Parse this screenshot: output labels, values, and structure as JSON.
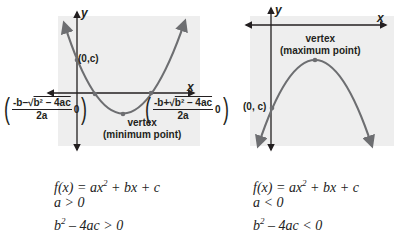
{
  "colors": {
    "background_panel": "#eeeeee",
    "curve": "#6d6e71",
    "axis": "#231f20",
    "text": "#231f20"
  },
  "left_graph": {
    "axis_labels": {
      "x": "x",
      "y": "y"
    },
    "y_intercept_label": "(0,c)",
    "vertex_label_line1": "vertex",
    "vertex_label_line2": "(minimum point)",
    "root_left": {
      "numerator_prefix": "-b–√",
      "radicand": "b² – 4ac",
      "denominator": "2a",
      "y": "0"
    },
    "root_right": {
      "numerator_prefix": "-b+√",
      "radicand": "b² – 4ac",
      "denominator": "2a",
      "y": "0"
    },
    "opens": "up"
  },
  "right_graph": {
    "axis_labels": {
      "x": "x",
      "y": "y"
    },
    "y_intercept_label": "(0, c)",
    "vertex_label_line1": "vertex",
    "vertex_label_line2": "(maximum point)",
    "opens": "down"
  },
  "left_conditions": {
    "function": "f(x) = ax",
    "function_exp": "2",
    "function_rest": " + bx + c",
    "a_condition": "a > 0",
    "disc_base": "b",
    "disc_exp": "2",
    "disc_rest": " – 4ac > 0"
  },
  "right_conditions": {
    "function": "f(x) = ax",
    "function_exp": "2",
    "function_rest": " + bx + c",
    "a_condition": "a < 0",
    "disc_base": "b",
    "disc_exp": "2",
    "disc_rest": " – 4ac < 0"
  }
}
